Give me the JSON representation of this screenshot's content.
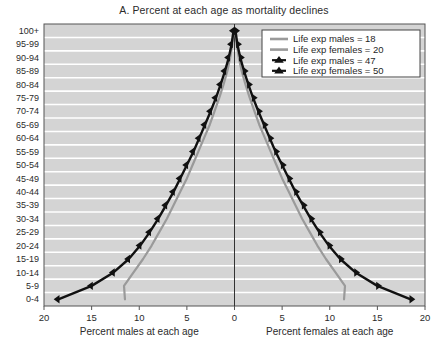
{
  "chart_data": {
    "type": "line",
    "title": "A. Percent at each age as mortality declines",
    "xlabel_left": "Percent males at each age",
    "xlabel_right": "Percent females at each age",
    "ylabel": "",
    "grid": true,
    "legend_position": "top-right",
    "plot_background": "#d4d4d4",
    "gridline_color": "#ffffff",
    "axis_color": "#555555",
    "categories": [
      "0-4",
      "5-9",
      "10-14",
      "15-19",
      "20-24",
      "25-29",
      "30-34",
      "35-39",
      "40-44",
      "45-49",
      "50-54",
      "55-59",
      "60-64",
      "65-69",
      "70-74",
      "75-79",
      "80-84",
      "85-89",
      "90-94",
      "95-99",
      "100+"
    ],
    "xticks_left": [
      20,
      15,
      10,
      5
    ],
    "xticks_right": [
      0,
      5,
      10,
      15,
      20
    ],
    "xlim": [
      0,
      20
    ],
    "series": [
      {
        "name": "Life exp males = 18",
        "side": "left",
        "color": "#9a9a9a",
        "marker": "none",
        "linewidth": 2.2,
        "values": [
          11.5,
          11.6,
          10.6,
          9.6,
          8.7,
          7.9,
          7.1,
          6.4,
          5.7,
          5.0,
          4.4,
          3.8,
          3.2,
          2.6,
          2.1,
          1.6,
          1.15,
          0.75,
          0.45,
          0.22,
          0.08
        ]
      },
      {
        "name": "Life exp females = 20",
        "side": "right",
        "color": "#9a9a9a",
        "marker": "none",
        "linewidth": 2.2,
        "values": [
          11.5,
          11.6,
          10.6,
          9.6,
          8.7,
          7.9,
          7.1,
          6.4,
          5.7,
          5.0,
          4.4,
          3.8,
          3.2,
          2.6,
          2.1,
          1.6,
          1.15,
          0.75,
          0.45,
          0.22,
          0.08
        ]
      },
      {
        "name": "Life exp males = 47",
        "side": "left",
        "color": "#111111",
        "marker": "triangle",
        "linewidth": 2.4,
        "values": [
          18.5,
          15.0,
          12.7,
          11.1,
          9.9,
          8.9,
          8.0,
          7.2,
          6.4,
          5.7,
          5.0,
          4.3,
          3.7,
          3.1,
          2.5,
          1.95,
          1.45,
          1.0,
          0.6,
          0.3,
          0.1
        ]
      },
      {
        "name": "Life exp females = 50",
        "side": "right",
        "color": "#111111",
        "marker": "triangle",
        "linewidth": 2.4,
        "values": [
          18.5,
          15.0,
          12.7,
          11.1,
          9.9,
          8.9,
          8.0,
          7.2,
          6.4,
          5.7,
          5.0,
          4.3,
          3.7,
          3.1,
          2.5,
          1.95,
          1.45,
          1.0,
          0.6,
          0.3,
          0.1
        ]
      }
    ],
    "legend_items": [
      {
        "label": "Life exp males = 18",
        "color": "#9a9a9a",
        "marker": "line"
      },
      {
        "label": "Life exp females = 20",
        "color": "#9a9a9a",
        "marker": "line"
      },
      {
        "label": "Life exp males = 47",
        "color": "#111111",
        "marker": "triangle"
      },
      {
        "label": "Life exp females = 50",
        "color": "#111111",
        "marker": "triangle"
      }
    ]
  }
}
